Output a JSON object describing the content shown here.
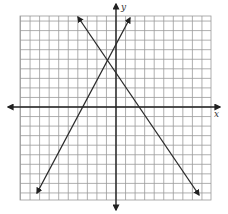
{
  "chart_data": {
    "type": "line",
    "title": "",
    "xlabel": "x",
    "ylabel": "y",
    "grid": true,
    "xlim": [
      -10,
      10
    ],
    "ylim": [
      -9.5,
      9.5
    ],
    "tick_labels": false,
    "series": [
      {
        "name": "line-rising",
        "description": "y = 2x + 7",
        "x": [
          -8.2,
          1.5
        ],
        "y": [
          -9.4,
          10.0
        ],
        "arrows": "both"
      },
      {
        "name": "line-falling",
        "description": "y = -5/3 x + 10/3",
        "x": [
          -4.0,
          8.7
        ],
        "y": [
          10.0,
          -11.2
        ],
        "arrows": "both"
      }
    ],
    "annotations": [
      {
        "type": "intersection",
        "x": -1,
        "y": 5
      }
    ]
  },
  "labels": {
    "x_axis": "x",
    "y_axis": "y"
  },
  "colors": {
    "grid": "#9a9a9a",
    "axis": "#222222",
    "line": "#2a2a2a",
    "background": "#ffffff"
  },
  "layout": {
    "grid_left": 20,
    "grid_top": 16,
    "grid_right": 211,
    "grid_bottom": 200,
    "origin_x": 116,
    "origin_y": 107,
    "cell": 9.55
  }
}
